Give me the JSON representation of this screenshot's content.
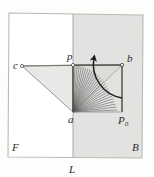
{
  "figure": {
    "canvas": {
      "width": 154,
      "height": 177
    },
    "background_color": "#fdfdfc"
  },
  "regions": {
    "front_plane": {
      "label": "F",
      "label_x": 12,
      "label_y": 151,
      "fill": "#ffffff",
      "description": "unshaded left half-plane"
    },
    "back_plane": {
      "label": "B",
      "label_x": 134,
      "label_y": 151,
      "fill": "#e2e2e0",
      "description": "shaded right half-plane"
    },
    "outer_frame": {
      "points": "9,13 143,15 142,158 8,157",
      "stroke": "#b9b9b5"
    },
    "shaded_panel": {
      "points": "73,14 143,15 142,158 73,157"
    }
  },
  "divider": {
    "label": "L",
    "label_x": 71,
    "label_y": 173,
    "x1": 73,
    "y1": 14,
    "x2": 73,
    "y2": 157,
    "stroke": "#a8a8a4"
  },
  "points": [
    {
      "id": "c",
      "label": "c",
      "x": 22,
      "y": 66,
      "label_x": 13,
      "label_y": 69,
      "marker": "open-dot"
    },
    {
      "id": "p",
      "label": "p",
      "x": 73,
      "y": 65,
      "label_x": 67,
      "label_y": 60,
      "marker": "open-dot"
    },
    {
      "id": "b",
      "label": "b",
      "x": 122,
      "y": 65,
      "label_x": 127,
      "label_y": 62,
      "marker": "open-dot"
    },
    {
      "id": "a",
      "label": "a",
      "x": 73,
      "y": 112,
      "label_x": 68,
      "label_y": 123,
      "marker": "none"
    },
    {
      "id": "P0",
      "label": "P",
      "sub": "0",
      "x": 122,
      "y": 112,
      "label_x": 121,
      "label_y": 124,
      "marker": "none"
    }
  ],
  "shapes": {
    "left_triangle": {
      "name": "triangle-c-p-a",
      "points": "22,66 73,65 73,112",
      "fill": "#e8e8e6",
      "stroke": "#8d8d89"
    },
    "mid_triangle": {
      "name": "triangle-p-a-b",
      "points": "73,65 73,112 122,65",
      "fill": "#dcdcda",
      "stroke": "#9a9a96"
    },
    "fan_wedge": {
      "name": "ray-fan-wedge",
      "apex_x": 73,
      "apex_y": 112,
      "from_x": 73,
      "from_y": 65,
      "to_x": 122,
      "to_y": 112,
      "ray_count": 27,
      "stroke": "#555553"
    },
    "vertical_ray": {
      "name": "segment-p-a",
      "x1": 73,
      "y1": 65,
      "x2": 73,
      "y2": 112,
      "stroke": "#4a4a48"
    },
    "right_edge_ray": {
      "name": "segment-b-P0",
      "x1": 122,
      "y1": 65,
      "x2": 122,
      "y2": 112,
      "stroke": "#3c3c3a"
    },
    "top_edge_ray": {
      "name": "segment-p-b",
      "x1": 73,
      "y1": 65,
      "x2": 122,
      "y2": 65,
      "stroke": "#3c3c3a"
    },
    "c_to_b_line": {
      "name": "segment-c-b",
      "x1": 22,
      "y1": 66,
      "x2": 122,
      "y2": 65,
      "stroke": "#6d6d6a"
    },
    "a_to_P0_line": {
      "name": "segment-a-P0",
      "x1": 73,
      "y1": 112,
      "x2": 122,
      "y2": 112,
      "stroke": "#8a8a86"
    }
  },
  "rotation_arrow": {
    "name": "rotation-arc-arrow",
    "path": "M 122,98 A 34,34 0 0 1 94,58",
    "stroke": "#1d1d1b",
    "arrowhead_at": "top",
    "direction": "counter-clockwise"
  }
}
